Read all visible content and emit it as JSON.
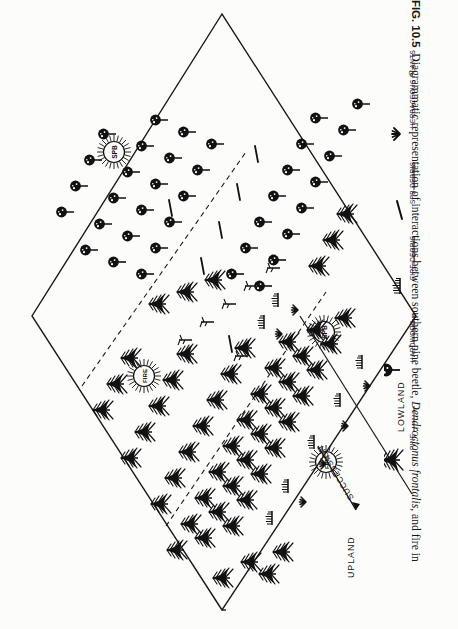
{
  "figure": {
    "number": "FIG. 10.5",
    "caption_text": "Diagrammatic representation of interactions between southern pine beetle, ",
    "species_name": "Dendroctonus frontalis",
    "caption_tail": ", and fire in",
    "orientation": "rotated-90"
  },
  "plate": {
    "zones": [
      {
        "label": "UPLAND"
      },
      {
        "label": "LOWLAND"
      }
    ],
    "process_arrows": [
      {
        "label": "SUCCESSION"
      }
    ],
    "events": [
      {
        "label": "SPB",
        "kind": "sunburst"
      },
      {
        "label": "SPB",
        "kind": "sunburst"
      },
      {
        "label": "FIRE",
        "kind": "sunburst"
      },
      {
        "label": "FIRE",
        "kind": "sunburst"
      }
    ]
  },
  "legend": {
    "items": [
      {
        "label": "PINE",
        "icon": "pine-tree-icon"
      },
      {
        "label": "HARDWOOD",
        "icon": "hardwood-tree-icon"
      },
      {
        "label": "FIRE DEBRIS",
        "icon": "fire-debris-icon"
      },
      {
        "label": "SPB DEBRIS",
        "icon": "spb-debris-icon"
      },
      {
        "label": "HERBACEOUS PLANTS",
        "icon": "herbaceous-plants-icon"
      }
    ]
  },
  "colors": {
    "ink": "#111111",
    "paper": "#fcfcfa",
    "rule": "#1a1a1a"
  }
}
